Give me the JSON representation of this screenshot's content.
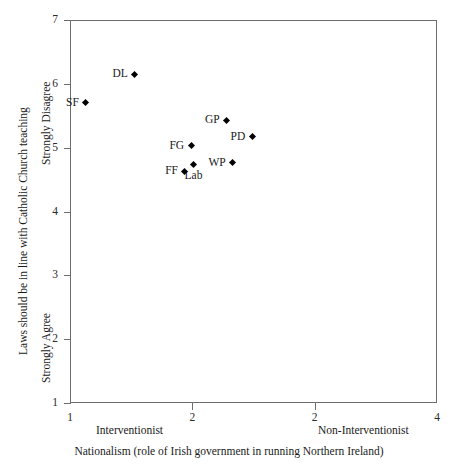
{
  "chart_data": {
    "type": "scatter",
    "title": "",
    "xlabel": "Nationalism (role of Irish government in running Northern Ireland)",
    "ylabel": "Laws should be in line with Catholic Church teaching",
    "xlim": [
      1,
      4
    ],
    "ylim": [
      1,
      7
    ],
    "grid": false,
    "legend": null,
    "x_axis": {
      "tick_labels": [
        "1",
        "2",
        "2",
        "4"
      ],
      "tick_values": [
        1,
        2,
        3,
        4
      ],
      "low_anchor": "Interventionist",
      "high_anchor": "Non-Interventionist",
      "caption": "Nationalism (role of Irish government in running Northern Ireland)"
    },
    "y_axis": {
      "tick_labels": [
        "7",
        "6",
        "5",
        "4",
        "3",
        "2",
        "1"
      ],
      "tick_values": [
        7,
        6,
        5,
        4,
        3,
        2,
        1
      ],
      "high_anchor": "Strongly Disagree",
      "low_anchor": "Strongly Agree",
      "caption": "Laws should be in line with Catholic Church teaching"
    },
    "points": [
      {
        "label": "DL",
        "x": 1.53,
        "y": 6.15,
        "label_position": "left"
      },
      {
        "label": "SF",
        "x": 1.13,
        "y": 5.7,
        "label_position": "left"
      },
      {
        "label": "GP",
        "x": 2.28,
        "y": 5.43,
        "label_position": "left"
      },
      {
        "label": "PD",
        "x": 2.49,
        "y": 5.17,
        "label_position": "left"
      },
      {
        "label": "FG",
        "x": 1.99,
        "y": 5.03,
        "label_position": "left"
      },
      {
        "label": "WP",
        "x": 2.33,
        "y": 4.76,
        "label_position": "left"
      },
      {
        "label": "Lab",
        "x": 2.01,
        "y": 4.73,
        "label_position": "below"
      },
      {
        "label": "FF",
        "x": 1.94,
        "y": 4.63,
        "label_position": "left"
      }
    ],
    "marker_style": "filled-diamond",
    "marker_color": "#000000",
    "frame_color": "#6d6d6d",
    "background_color": "#ffffff"
  }
}
